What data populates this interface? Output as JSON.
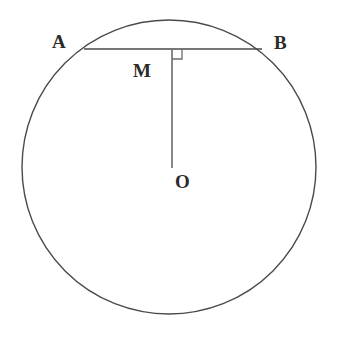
{
  "figure": {
    "background_color": "#ffffff",
    "stroke_color": "#4a4a4a",
    "label_color": "#2b2b2b"
  },
  "labels": {
    "A": "A",
    "B": "B",
    "M": "M",
    "O": "O"
  },
  "geometry": {
    "circle": {
      "cx": 169,
      "cy": 167,
      "r": 147
    },
    "chord": {
      "x1": 84,
      "y1": 49,
      "x2": 262,
      "y2": 49
    },
    "perpendicular": {
      "x1": 172,
      "y1": 49,
      "x2": 172,
      "y2": 168
    },
    "right_angle_marker": {
      "x": 172,
      "y": 49,
      "size": 10
    },
    "points": {
      "A": {
        "x": 84,
        "y": 49
      },
      "B": {
        "x": 262,
        "y": 49
      },
      "M": {
        "x": 172,
        "y": 49
      },
      "O": {
        "x": 172,
        "y": 168
      }
    }
  }
}
